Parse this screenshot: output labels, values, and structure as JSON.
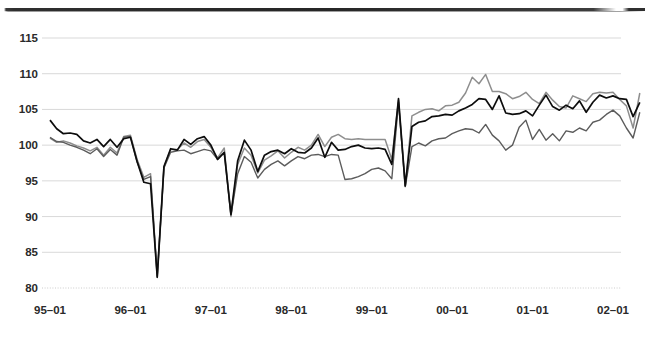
{
  "figure": {
    "name": "time-series-line-chart",
    "caption_fragment": ""
  },
  "chart_data": {
    "type": "line",
    "title": "",
    "subtitle": "",
    "xlabel": "",
    "ylabel": "",
    "grid": true,
    "legend_position": "none",
    "ylim": [
      80,
      117
    ],
    "yticks": [
      80,
      85,
      90,
      95,
      100,
      105,
      110,
      115
    ],
    "ytick_labels": [
      "80",
      "85",
      "90",
      "95",
      "100",
      "105",
      "110",
      "115"
    ],
    "xtick_labels": [
      "95–01",
      "96–01",
      "97–01",
      "98–01",
      "99–01",
      "00–01",
      "01–01",
      "02–01"
    ],
    "xtick_indices": [
      0,
      12,
      24,
      36,
      48,
      60,
      72,
      84
    ],
    "x_start": "95-01",
    "x_end": "02-01",
    "x_count": 85,
    "colors": {
      "series_1": "#0d0d0d",
      "series_2": "#8e8e8e",
      "series_3": "#5c5c5c",
      "gridline": "#d9d9d9",
      "baseline": "#cccccc",
      "text": "#2a2a2a",
      "background": "#ffffff"
    },
    "series": [
      {
        "name": "series-1-black",
        "color": "#0d0d0d",
        "values": [
          103.5,
          102.3,
          101.6,
          101.7,
          101.5,
          100.6,
          100.3,
          100.8,
          99.8,
          100.8,
          99.7,
          100.9,
          101.1,
          97.7,
          94.8,
          94.6,
          81.5,
          97.0,
          99.5,
          99.3,
          100.8,
          100.1,
          100.9,
          101.2,
          100.0,
          98.0,
          99.0,
          90.3,
          97.8,
          100.7,
          99.3,
          96.3,
          98.6,
          99.1,
          99.3,
          98.8,
          99.5,
          99.0,
          98.9,
          99.6,
          101.0,
          98.3,
          100.4,
          99.3,
          99.4,
          99.8,
          100.0,
          99.6,
          99.5,
          99.6,
          99.4,
          97.3,
          106.5,
          94.3,
          102.6,
          103.2,
          103.4,
          104.0,
          104.1,
          104.3,
          104.2,
          104.8,
          105.2,
          105.7,
          106.5,
          106.4,
          105.0,
          106.9,
          104.5,
          104.3,
          104.4,
          104.8,
          104.1,
          105.6,
          107.0,
          105.4,
          104.9,
          105.6,
          105.1,
          106.2,
          104.6,
          106.0,
          107.0,
          106.6,
          106.9,
          106.5,
          106.4,
          104.0,
          106.0
        ],
        "notes": "Heavy black center line; deep trough 81.5 at 96-05, trough 90.3 at 97-04, spike 106.5/94.3 at 99-01/99-02."
      },
      {
        "name": "series-2-gray-upper",
        "color": "#8e8e8e",
        "values": [
          101.0,
          100.4,
          100.6,
          100.3,
          99.9,
          99.6,
          99.2,
          99.7,
          98.6,
          99.7,
          98.9,
          101.2,
          101.4,
          98.0,
          95.5,
          96.0,
          81.5,
          96.9,
          99.4,
          99.4,
          100.3,
          99.7,
          100.5,
          100.8,
          99.7,
          98.2,
          99.6,
          90.0,
          97.3,
          99.6,
          98.6,
          96.1,
          97.9,
          98.5,
          99.2,
          98.2,
          99.0,
          99.7,
          99.3,
          100.0,
          101.5,
          99.8,
          101.1,
          101.5,
          100.9,
          100.8,
          100.9,
          100.8,
          100.8,
          100.8,
          100.8,
          98.0,
          106.3,
          94.3,
          104.1,
          104.6,
          105.0,
          105.1,
          104.8,
          105.5,
          105.6,
          106.0,
          107.3,
          109.5,
          108.6,
          109.9,
          107.5,
          107.5,
          107.2,
          106.5,
          106.8,
          107.4,
          106.4,
          105.8,
          107.4,
          106.3,
          105.4,
          105.2,
          106.9,
          106.5,
          106.1,
          107.2,
          107.4,
          107.3,
          107.4,
          106.4,
          105.5,
          102.4,
          107.3
        ],
        "notes": "Upper light-gray line; peaks near 109.9 around 00-06, ends ~107.3."
      },
      {
        "name": "series-3-gray-lower",
        "color": "#5c5c5c",
        "values": [
          101.1,
          100.5,
          100.4,
          100.0,
          99.7,
          99.3,
          98.8,
          99.5,
          98.4,
          99.4,
          98.6,
          101.1,
          101.2,
          97.6,
          95.2,
          95.6,
          81.7,
          96.8,
          99.0,
          99.2,
          99.3,
          98.8,
          99.1,
          99.4,
          99.2,
          98.0,
          98.9,
          90.2,
          96.0,
          98.4,
          97.6,
          95.4,
          96.6,
          97.3,
          97.8,
          97.1,
          97.8,
          98.4,
          98.1,
          98.6,
          98.7,
          98.4,
          98.7,
          98.6,
          95.2,
          95.3,
          95.6,
          96.0,
          96.6,
          96.8,
          96.4,
          95.3,
          106.0,
          94.2,
          99.8,
          100.3,
          99.9,
          100.6,
          100.9,
          101.0,
          101.6,
          102.0,
          102.3,
          102.2,
          101.7,
          102.9,
          101.4,
          100.6,
          99.3,
          100.0,
          102.5,
          103.5,
          100.8,
          102.2,
          100.7,
          101.6,
          100.6,
          102.0,
          101.8,
          102.4,
          102.0,
          103.2,
          103.5,
          104.3,
          104.9,
          104.1,
          102.4,
          101.0,
          104.6
        ],
        "notes": "Lower mid-gray line; dips to ~95.2 through 98, recovers to ~104.6 by 02-01."
      }
    ]
  }
}
